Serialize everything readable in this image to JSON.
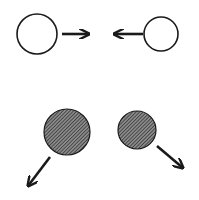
{
  "diagram": {
    "colors": {
      "background": "#ffffff",
      "stroke": "#1a1a1a",
      "hatch_dark": "#2a2a2a",
      "hatch_light": "#8a8a8a"
    },
    "before": {
      "particles": [
        {
          "id": "left-particle",
          "cx": 37,
          "cy": 34,
          "r": 20,
          "filled": false
        },
        {
          "id": "right-particle",
          "cx": 161,
          "cy": 34,
          "r": 17,
          "filled": false
        }
      ],
      "arrows": [
        {
          "id": "left-velocity-arrow",
          "x1": 62,
          "y1": 34,
          "x2": 89,
          "y2": 34,
          "direction": "right"
        },
        {
          "id": "right-velocity-arrow",
          "x1": 143,
          "y1": 34,
          "x2": 114,
          "y2": 34,
          "direction": "left"
        }
      ]
    },
    "after": {
      "particles": [
        {
          "id": "left-particle-after",
          "cx": 67,
          "cy": 132,
          "r": 23,
          "filled": true
        },
        {
          "id": "right-particle-after",
          "cx": 137,
          "cy": 130,
          "r": 19,
          "filled": true
        }
      ],
      "arrows": [
        {
          "id": "left-after-velocity-arrow",
          "x1": 50,
          "y1": 157,
          "x2": 28,
          "y2": 186,
          "direction": "down-left"
        },
        {
          "id": "right-after-velocity-arrow",
          "x1": 157,
          "y1": 146,
          "x2": 183,
          "y2": 168,
          "direction": "down-right"
        }
      ]
    }
  }
}
